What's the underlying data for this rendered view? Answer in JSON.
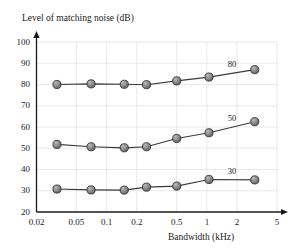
{
  "chart_data": {
    "type": "line",
    "title": "",
    "xlabel": "Bandwidth (kHz)",
    "ylabel": "Level of matching noise (dB)",
    "xscale": "log",
    "yscale": "linear",
    "xlim": [
      0.02,
      5
    ],
    "ylim": [
      20,
      100
    ],
    "grid": true,
    "legend_position": "inline-right-of-curve",
    "xticks": [
      "0.02",
      "0.05",
      "0.1",
      "0.2",
      "0.5",
      "1",
      "2",
      "5"
    ],
    "xtick_values": [
      0.02,
      0.05,
      0.1,
      0.2,
      0.5,
      1,
      2,
      5
    ],
    "yticks": [
      "20",
      "30",
      "40",
      "50",
      "60",
      "70",
      "80",
      "90",
      "100"
    ],
    "ytick_values": [
      20,
      30,
      40,
      50,
      60,
      70,
      80,
      90,
      100
    ],
    "x": [
      0.032,
      0.07,
      0.15,
      0.25,
      0.5,
      1.05,
      3.0
    ],
    "series": [
      {
        "name": "80",
        "label": "80",
        "values": [
          80.0,
          80.3,
          80.1,
          79.9,
          81.7,
          83.5,
          87.0
        ]
      },
      {
        "name": "50",
        "label": "50",
        "values": [
          51.8,
          50.7,
          50.2,
          50.7,
          54.6,
          57.3,
          62.5
        ]
      },
      {
        "name": "30",
        "label": "30",
        "values": [
          30.8,
          30.4,
          30.3,
          31.7,
          32.2,
          35.3,
          35.1
        ]
      }
    ],
    "marker": "filled-circle-shaded",
    "marker_color": "#808080",
    "marker_edge_color": "#333333",
    "line_color": "#3a3a3a",
    "grid_color": "#d9d9e4",
    "axis_color": "#1a1a1a",
    "background_color": "#ffffff"
  }
}
